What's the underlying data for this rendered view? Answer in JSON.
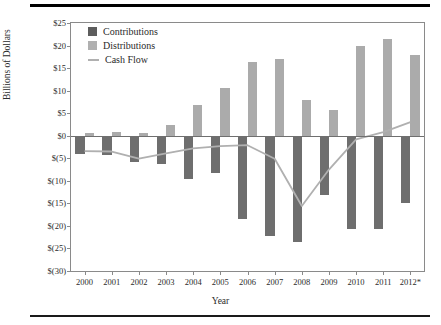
{
  "figure": {
    "axis_x_title": "Year",
    "axis_y_title": "Billions of Dollars"
  },
  "legend": {
    "position": "top-left-inside",
    "items": [
      {
        "label": "Contributions",
        "marker": "square-swatch-icon",
        "color": "#5d5d5d"
      },
      {
        "label": "Distributions",
        "marker": "square-swatch-icon",
        "color": "#b0b0b0"
      },
      {
        "label": "Cash Flow",
        "marker": "line-swatch-icon",
        "color": "#b0b0b0"
      }
    ]
  },
  "chart_data": {
    "type": "bar",
    "title": "",
    "subtitle": "",
    "xlabel": "Year",
    "ylabel": "Billions of Dollars",
    "categories": [
      "2000",
      "2001",
      "2002",
      "2003",
      "2004",
      "2005",
      "2006",
      "2007",
      "2008",
      "2009",
      "2010",
      "2011",
      "2012*"
    ],
    "ylim": [
      -30,
      25
    ],
    "ytick_values": [
      25,
      20,
      15,
      10,
      5,
      0,
      -5,
      -10,
      -15,
      -20,
      -25,
      -30
    ],
    "ytick_labels": [
      "$25",
      "$20",
      "$15",
      "$10",
      "$5",
      "$0",
      "$(5)",
      "$(10)",
      "$(15)",
      "$(20)",
      "$(25)",
      "$(30)"
    ],
    "grid": false,
    "zero_line": true,
    "series": [
      {
        "name": "Contributions",
        "type": "bar",
        "color": "#6e6e6e",
        "values": [
          -4.0,
          -4.3,
          -5.8,
          -6.2,
          -9.7,
          -8.3,
          -18.5,
          -22.2,
          -23.6,
          -13.2,
          -20.6,
          -20.6,
          -15.0
        ]
      },
      {
        "name": "Distributions",
        "type": "bar",
        "color": "#ababab",
        "values": [
          0.6,
          0.8,
          0.7,
          2.3,
          6.9,
          10.6,
          16.4,
          17.1,
          8.0,
          5.7,
          19.8,
          21.4,
          18.0
        ]
      },
      {
        "name": "Cash Flow",
        "type": "line",
        "color": "#b0b0b0",
        "values": [
          -3.4,
          -3.5,
          -5.1,
          -3.9,
          -2.8,
          -2.3,
          -2.1,
          -5.1,
          -15.6,
          -7.5,
          -0.8,
          0.8,
          3.0
        ]
      }
    ]
  }
}
